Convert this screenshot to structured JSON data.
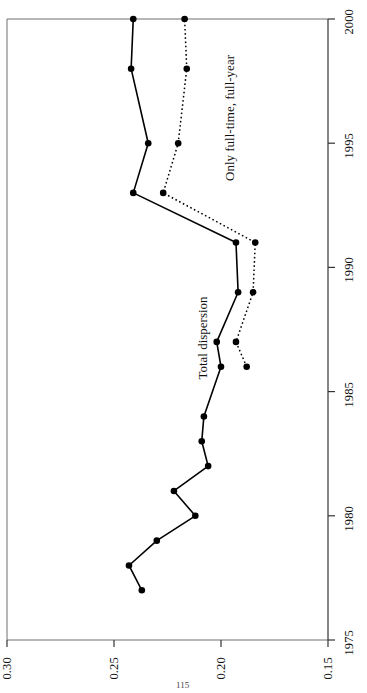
{
  "page": {
    "number": "115"
  },
  "chart_data": {
    "type": "line",
    "title": "",
    "xlabel": "",
    "ylabel": "",
    "orientation": "rotated-90-ccw",
    "note": "Chart is printed rotated 90 degrees counter-clockwise; year axis runs vertically (1975 bottom to 2000 top), dispersion-value axis runs horizontally (0.30 left to 0.15 right).",
    "x": [
      1977,
      1978,
      1979,
      1980,
      1981,
      1982,
      1983,
      1984,
      1986,
      1987,
      1989,
      1991,
      1993,
      1995,
      1998,
      2000
    ],
    "xlim": [
      1975,
      2000
    ],
    "ylim": [
      0.15,
      0.3
    ],
    "xticks": [
      "1975",
      "1980",
      "1985",
      "1990",
      "1995",
      "2000"
    ],
    "yticks": [
      "0.30",
      "0.25",
      "0.20",
      "0.15"
    ],
    "grid": false,
    "legend_position": "inline-annotations",
    "series": [
      {
        "name": "Total dispersion",
        "style": "solid",
        "marker": "filled-circle",
        "color": "#000000",
        "x": [
          1977,
          1978,
          1979,
          1980,
          1981,
          1982,
          1983,
          1984,
          1986,
          1987,
          1989,
          1991,
          1993,
          1995,
          1998,
          2000
        ],
        "values": [
          0.237,
          0.243,
          0.23,
          0.212,
          0.222,
          0.206,
          0.209,
          0.208,
          0.2,
          0.202,
          0.192,
          0.193,
          0.241,
          0.234,
          0.242,
          0.241
        ]
      },
      {
        "name": "Only full-time, full-year",
        "style": "dotted",
        "marker": "filled-circle",
        "color": "#000000",
        "x": [
          1986,
          1987,
          1989,
          1991,
          1993,
          1995,
          1998,
          2000
        ],
        "values": [
          0.188,
          0.193,
          0.185,
          0.184,
          0.227,
          0.22,
          0.216,
          0.217
        ]
      }
    ],
    "annotations": [
      {
        "text": "Total dispersion",
        "near_x": 1987,
        "near_y": 0.205
      },
      {
        "text": "Only full-time, full-year",
        "near_x": 1996,
        "near_y": 0.205
      }
    ]
  },
  "axes": {
    "year_ticks": [
      {
        "label": "1975",
        "value": 1975
      },
      {
        "label": "1980",
        "value": 1980
      },
      {
        "label": "1985",
        "value": 1985
      },
      {
        "label": "1990",
        "value": 1990
      },
      {
        "label": "1995",
        "value": 1995
      },
      {
        "label": "2000",
        "value": 2000
      }
    ],
    "value_ticks": [
      {
        "label": "0.30",
        "value": 0.3
      },
      {
        "label": "0.25",
        "value": 0.25
      },
      {
        "label": "0.20",
        "value": 0.2
      },
      {
        "label": "0.15",
        "value": 0.15
      }
    ]
  },
  "labels": {
    "total_dispersion": "Total dispersion",
    "full_time_full_year": "Only full-time, full-year"
  },
  "colors": {
    "ink": "#000000",
    "axis": "#6f6f6f"
  }
}
